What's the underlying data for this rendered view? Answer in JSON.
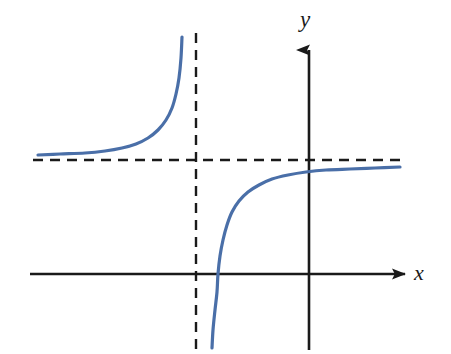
{
  "figure": {
    "title": "",
    "background_color": "#ffffff",
    "width": 451,
    "height": 354
  },
  "axes": {
    "x_label": "x",
    "y_label": "y",
    "axis_color": "#1a1a1a",
    "x_axis": {
      "name": "x-axis",
      "y_pixel": 274,
      "x_start_pixel": 30,
      "x_end_pixel": 412,
      "arrow": "right"
    },
    "y_axis": {
      "name": "y-axis",
      "x_pixel": 309,
      "y_start_pixel": 350,
      "y_end_pixel": 42,
      "arrow": "up"
    }
  },
  "asymptotes": {
    "color": "#1a1a1a",
    "style": "dashed",
    "dash_pattern": "10 7",
    "vertical": {
      "name": "vertical-asymptote",
      "x_pixel": 196,
      "y_start_pixel": 33,
      "y_end_pixel": 350
    },
    "horizontal": {
      "name": "horizontal-asymptote",
      "y_pixel": 160,
      "x_start_pixel": 33,
      "x_end_pixel": 405
    }
  },
  "chart_data": {
    "type": "line",
    "title": "",
    "xlabel": "x",
    "ylabel": "y",
    "grid": false,
    "legend": null,
    "curve_color": "#4a6fa8",
    "curve_width": 3.2,
    "annotations": [
      "vertical asymptote (dashed) left of the y-axis",
      "horizontal asymptote (dashed) above the x-axis",
      "left branch lies above the horizontal asymptote and rises to +infinity at the vertical asymptote",
      "right branch comes up from -infinity at the vertical asymptote, crosses the x-axis, and approaches the horizontal asymptote from below"
    ],
    "series": [
      {
        "name": "left-branch",
        "points_pixel": [
          [
            38,
            155
          ],
          [
            60,
            154
          ],
          [
            85,
            153
          ],
          [
            105,
            151
          ],
          [
            122,
            148
          ],
          [
            136,
            144
          ],
          [
            148,
            138
          ],
          [
            158,
            130
          ],
          [
            166,
            120
          ],
          [
            172,
            108
          ],
          [
            176,
            94
          ],
          [
            179,
            78
          ],
          [
            181,
            58
          ],
          [
            182,
            37
          ]
        ]
      },
      {
        "name": "right-branch",
        "points_pixel": [
          [
            212,
            348
          ],
          [
            213,
            330
          ],
          [
            215,
            310
          ],
          [
            217,
            292
          ],
          [
            218,
            274
          ],
          [
            220,
            256
          ],
          [
            223,
            240
          ],
          [
            227,
            225
          ],
          [
            232,
            212
          ],
          [
            239,
            201
          ],
          [
            248,
            192
          ],
          [
            259,
            185
          ],
          [
            272,
            179
          ],
          [
            288,
            175
          ],
          [
            306,
            172
          ],
          [
            326,
            170
          ],
          [
            350,
            169
          ],
          [
            375,
            168
          ],
          [
            400,
            167
          ]
        ]
      }
    ],
    "x_axis_crossing_pixel": [
      218,
      274
    ],
    "axis_ranges_pixel": {
      "x": [
        30,
        412
      ],
      "y": [
        42,
        350
      ]
    }
  }
}
